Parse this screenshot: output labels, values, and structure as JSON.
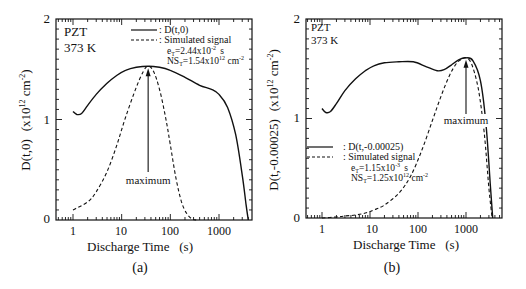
{
  "chart_data": [
    {
      "panel": "(a)",
      "type": "line",
      "title": "",
      "annotations": [
        "PZT",
        "373 K",
        "maximum"
      ],
      "xlabel": "Discharge Time   (s)",
      "ylabel": "D(t,0)   (x10^12 cm^-2)",
      "xscale": "log",
      "xlim": [
        0.5,
        4200
      ],
      "ylim": [
        0,
        2
      ],
      "x_ticks": [
        "1",
        "10",
        "100",
        "1000"
      ],
      "y_ticks": [
        "0",
        "1",
        "2"
      ],
      "grid": false,
      "legend": {
        "position": "top-right",
        "entries": [
          {
            "style": "solid",
            "label": ": D(t,0)"
          },
          {
            "style": "dashed",
            "label": ": Simulated signal"
          }
        ],
        "params": [
          "eT=2.44x10^-2  s",
          "NST=1.54x10^12 cm^-2"
        ]
      },
      "series": [
        {
          "name": "D(t,0)",
          "style": "solid",
          "x": [
            1,
            1.2,
            1.5,
            2,
            3,
            5,
            8,
            12,
            20,
            35,
            60,
            100,
            200,
            400,
            700,
            1000,
            1500,
            2200,
            3000,
            3600,
            4000
          ],
          "y": [
            1.08,
            1.05,
            1.06,
            1.14,
            1.25,
            1.36,
            1.44,
            1.49,
            1.52,
            1.53,
            1.52,
            1.49,
            1.42,
            1.34,
            1.3,
            1.25,
            1.12,
            0.85,
            0.45,
            0.15,
            0.0
          ]
        },
        {
          "name": "Simulated signal",
          "style": "dashed",
          "x": [
            1,
            2,
            3,
            5,
            8,
            12,
            20,
            28,
            35,
            45,
            60,
            80,
            100,
            130,
            170,
            220,
            280,
            340
          ],
          "y": [
            0.1,
            0.18,
            0.28,
            0.48,
            0.75,
            1.02,
            1.32,
            1.48,
            1.53,
            1.48,
            1.3,
            1.02,
            0.75,
            0.42,
            0.18,
            0.06,
            0.01,
            0.0
          ]
        }
      ],
      "maximum_at_x": 35,
      "maximum_y": 1.53
    },
    {
      "panel": "(b)",
      "type": "line",
      "title": "",
      "annotations": [
        "PZT",
        "373 K",
        "maximum"
      ],
      "xlabel": "Discharge Time   (s)",
      "ylabel": "D(t,-0.00025)   (x10^12 cm^-2)",
      "xscale": "log",
      "xlim": [
        0.5,
        3900
      ],
      "ylim": [
        0,
        2
      ],
      "x_ticks": [
        "1",
        "10",
        "100",
        "1000"
      ],
      "y_ticks": [
        "0",
        "1",
        "2"
      ],
      "grid": false,
      "legend": {
        "position": "lower-left",
        "entries": [
          {
            "style": "solid",
            "label": ": D(t,-0.00025)"
          },
          {
            "style": "dashed",
            "label": ": Simulated signal"
          }
        ],
        "params": [
          "eT=1.15x10^-3  s",
          "NST=1.25x10^12 cm^-2"
        ]
      },
      "series": [
        {
          "name": "D(t,-0.00025)",
          "style": "solid",
          "x": [
            1,
            1.2,
            1.5,
            2,
            3,
            5,
            8,
            12,
            20,
            40,
            80,
            150,
            250,
            350,
            500,
            700,
            1000,
            1400,
            2000,
            2600,
            3200,
            3600
          ],
          "y": [
            1.1,
            1.06,
            1.07,
            1.15,
            1.28,
            1.4,
            1.48,
            1.53,
            1.56,
            1.57,
            1.57,
            1.52,
            1.48,
            1.49,
            1.54,
            1.59,
            1.61,
            1.58,
            1.38,
            0.95,
            0.35,
            0.0
          ]
        },
        {
          "name": "Simulated signal",
          "style": "dashed",
          "x": [
            1,
            2,
            3,
            5,
            8,
            12,
            20,
            40,
            70,
            120,
            200,
            300,
            450,
            650,
            850,
            1000,
            1300,
            1800,
            2400,
            3000,
            3500
          ],
          "y": [
            0.0,
            0.01,
            0.02,
            0.03,
            0.05,
            0.08,
            0.13,
            0.25,
            0.42,
            0.68,
            0.98,
            1.22,
            1.43,
            1.56,
            1.6,
            1.61,
            1.55,
            1.3,
            0.85,
            0.3,
            0.0
          ]
        }
      ],
      "maximum_at_x": 1000,
      "maximum_y": 1.61
    }
  ],
  "panels": [
    {
      "label": "(a)",
      "sample": "PZT",
      "temp": "373 K",
      "max_label": "maximum",
      "xlabel": "Discharge Time   (s)",
      "ylabel_main": "D(t,0)",
      "ylabel_units": "(x10",
      "ylabel_exp": "12",
      "ylabel_units2": " cm",
      "ylabel_exp2": "-2",
      "ylabel_close": ")",
      "legend_solid": ": D(t,0)",
      "legend_dashed": ": Simulated signal",
      "param1_pre": "e",
      "param1_sub": "T",
      "param1_mid": "=2.44x10",
      "param1_exp": "-2",
      "param1_unit": "s",
      "param2_pre": "NS",
      "param2_sub": "T",
      "param2_mid": "=1.54x10",
      "param2_exp": "12",
      "param2_unit": " cm",
      "param2_uexp": "-2",
      "y_tick_labels": [
        "0",
        "1",
        "2"
      ],
      "x_tick_labels": [
        "1",
        "10",
        "100",
        "1000"
      ]
    },
    {
      "label": "(b)",
      "sample": "PZT",
      "temp": "373 K",
      "max_label": "maximum",
      "xlabel": "Discharge Time   (s)",
      "ylabel_main": "D(t,-0.00025)",
      "ylabel_units": "(x10",
      "ylabel_exp": "12",
      "ylabel_units2": " cm",
      "ylabel_exp2": "-2",
      "ylabel_close": ")",
      "legend_solid": ": D(t,-0.00025)",
      "legend_dashed": ": Simulated signal",
      "param1_pre": "e",
      "param1_sub": "T",
      "param1_mid": "=1.15x10",
      "param1_exp": "-3",
      "param1_unit": "s",
      "param2_pre": "NS",
      "param2_sub": "T",
      "param2_mid": "=1.25x10",
      "param2_exp": "12",
      "param2_unit": " cm",
      "param2_uexp": "-2",
      "y_tick_labels": [
        "0",
        "1",
        "2"
      ],
      "x_tick_labels": [
        "1",
        "10",
        "100",
        "1000"
      ]
    }
  ]
}
